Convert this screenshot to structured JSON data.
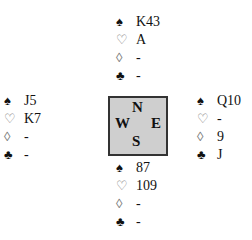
{
  "suits": {
    "spade": "♠",
    "heart": "♡",
    "diamond": "◊",
    "club": "♣"
  },
  "compass": {
    "north": "N",
    "west": "W",
    "east": "E",
    "south": "S"
  },
  "hands": {
    "north": {
      "spades": "K43",
      "hearts": "A",
      "diamonds": "-",
      "clubs": "-"
    },
    "west": {
      "spades": "J5",
      "hearts": "K7",
      "diamonds": "-",
      "clubs": "-"
    },
    "east": {
      "spades": "Q10",
      "hearts": "-",
      "diamonds": "9",
      "clubs": "J"
    },
    "south": {
      "spades": "87",
      "hearts": "109",
      "diamonds": "-",
      "clubs": "-"
    }
  },
  "colors": {
    "compass_fill": "#cfcfcf",
    "compass_border": "#333333"
  }
}
